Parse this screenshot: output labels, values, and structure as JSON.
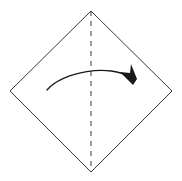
{
  "canvas": {
    "width": 182,
    "height": 181,
    "background_color": "#ffffff"
  },
  "diagram": {
    "type": "origami-fold-step",
    "line_color": "#3a3a3a",
    "arrow_color": "#1a1a1a",
    "shape": {
      "name": "square-rotated-45",
      "label": "paper-outline",
      "points": "91,11 172,91 91,172 10,91",
      "vertices": {
        "top": [
          91,
          11
        ],
        "right": [
          172,
          91
        ],
        "bottom": [
          91,
          172
        ],
        "left": [
          10,
          91
        ]
      }
    },
    "fold_line": {
      "name": "vertical-valley-fold",
      "style": "dashed",
      "dash_pattern": "5 5",
      "x1": 91,
      "y1": 11,
      "x2": 91,
      "y2": 172
    },
    "arrow": {
      "name": "fold-direction-arrow",
      "direction": "left-to-right",
      "path": "M 47,90 C 62,72 110,63 131,78",
      "head_points": "133,85 120,72 130,73 131,64 137,79",
      "tail_point": [
        47,
        90
      ],
      "tip_point": [
        133,
        85
      ]
    }
  }
}
